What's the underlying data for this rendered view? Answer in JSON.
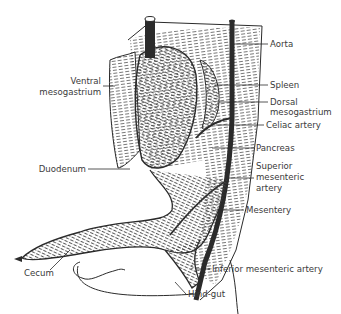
{
  "diagram": {
    "labels_right": {
      "aorta": "Aorta",
      "spleen": "Spleen",
      "dorsal_mesogastrium_1": "Dorsal",
      "dorsal_mesogastrium_2": "mesogastrium",
      "celiac_artery": "Celiac artery",
      "pancreas": "Pancreas",
      "sma_1": "Superior",
      "sma_2": "mesenteric",
      "sma_3": "artery",
      "mesentery": "Mesentery",
      "ima": "Inferior mesenteric artery",
      "hindgut": "Hind-gut"
    },
    "labels_left": {
      "ventral_mesogastrium_1": "Ventral",
      "ventral_mesogastrium_2": "mesogastrium",
      "duodenum": "Duodenum",
      "cecum": "Cecum"
    },
    "colors": {
      "ink": "#2b2b2b",
      "hatch": "#555555",
      "text": "#3a3a3a"
    }
  }
}
